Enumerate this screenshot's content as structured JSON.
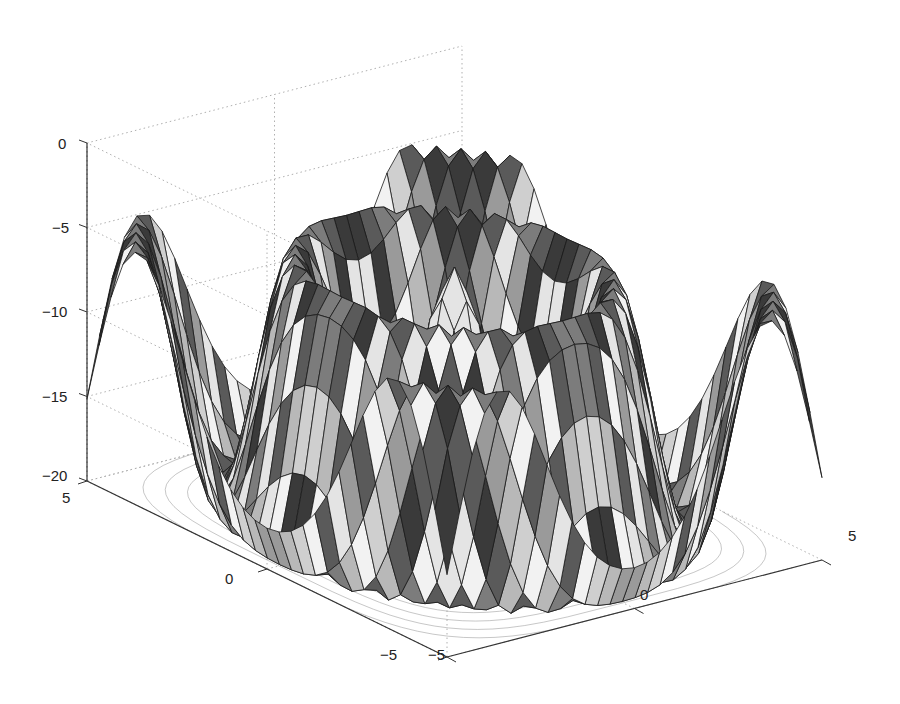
{
  "chart_data": {
    "type": "surface3d",
    "subtype": "surfc (surface with contour projected on base plane)",
    "title": "",
    "xlabel": "",
    "ylabel": "",
    "zlabel": "",
    "x_ticks": [
      "-5",
      "0",
      "5"
    ],
    "y_ticks": [
      "-5",
      "0",
      "5"
    ],
    "z_ticks": [
      "0",
      "-5",
      "-10",
      "-15",
      "-20"
    ],
    "xlim": [
      -5,
      5
    ],
    "ylim": [
      -5,
      5
    ],
    "zlim": [
      -20,
      0
    ],
    "grid": true,
    "grid_style": "dotted",
    "colormap": "gray",
    "shading": "faceted",
    "surface_description": "Radially symmetric oscillating surface with a central dome near z≈-5, concentric rings that dip to about -20 and rise back toward -5 to -9, and a contour plot projected onto the z=-20 floor",
    "grid_resolution": 31,
    "view": {
      "azimuth": -37.5,
      "elevation": 30
    }
  },
  "axes": {
    "z_tick_labels": [
      {
        "text": "0",
        "value": 0
      },
      {
        "text": "-5",
        "value": -5
      },
      {
        "text": "-10",
        "value": -10
      },
      {
        "text": "-15",
        "value": -15
      },
      {
        "text": "-20",
        "value": -20
      }
    ],
    "left_axis_tick_labels": [
      {
        "text": "5"
      },
      {
        "text": "0"
      },
      {
        "text": "-5"
      }
    ],
    "right_axis_tick_labels": [
      {
        "text": "-5"
      },
      {
        "text": "0"
      },
      {
        "text": "5"
      }
    ]
  },
  "colors": {
    "background": "#ffffff",
    "axis_line": "#333333",
    "grid_line": "#b0b0b0",
    "edge_line": "#1a1a1a",
    "contour_line": "#9a9a9a"
  }
}
